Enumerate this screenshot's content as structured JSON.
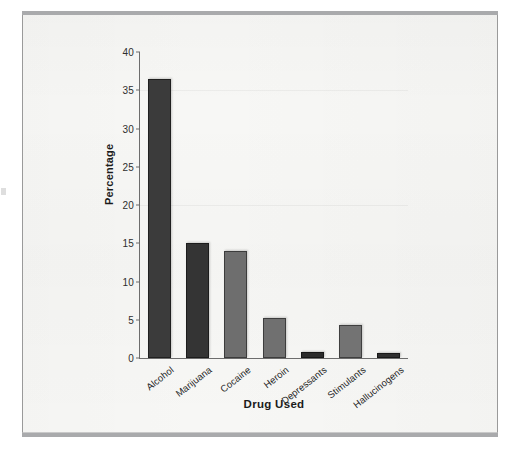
{
  "chart_data": {
    "type": "bar",
    "title": "",
    "xlabel": "Drug Used",
    "ylabel": "Percentage",
    "categories": [
      "Alcohol",
      "Marijuana",
      "Cocaine",
      "Heroin",
      "Depressants",
      "Stimulants",
      "Hallucinogens"
    ],
    "values": [
      36.5,
      15.0,
      14.0,
      5.2,
      0.8,
      4.3,
      0.6
    ],
    "bar_colors": [
      "#3b3b3b",
      "#343434",
      "#6e6e6e",
      "#707070",
      "#2b2b2b",
      "#737373",
      "#2f2f2f"
    ],
    "ylim": [
      0,
      40
    ],
    "yticks": [
      0,
      5,
      10,
      15,
      20,
      25,
      30,
      35,
      40
    ],
    "ytick_labels": [
      "0",
      "5",
      "10",
      "15",
      "20",
      "25",
      "30",
      "35",
      "40"
    ],
    "grid": false,
    "legend": "none",
    "xtick_rotation": -38
  },
  "figure": {
    "background": "#f7f7f5",
    "frame_color": "#9a9a9a",
    "rule_color": "#a9aaac",
    "axis_color": "#6d6d6d"
  }
}
